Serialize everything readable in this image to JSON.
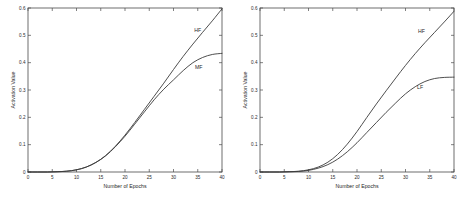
{
  "figure": {
    "background_color": "#ffffff",
    "axis_color": "#4a4a4a",
    "curve_color": "#3a3a3a",
    "text_color": "#1f1f1f"
  },
  "chart_data": [
    {
      "type": "line",
      "panel": "left",
      "title": "",
      "xlabel": "Number of Epochs",
      "ylabel": "Activation Value",
      "xlim": [
        0,
        40
      ],
      "ylim": [
        0,
        0.6
      ],
      "xticks": [
        0,
        5,
        10,
        15,
        20,
        25,
        30,
        35,
        40
      ],
      "xticklabels": [
        "0",
        "5",
        "10",
        "15",
        "20",
        "25",
        "30",
        "35",
        "40"
      ],
      "yticks": [
        0,
        0.1,
        0.2,
        0.3,
        0.4,
        0.5,
        0.6
      ],
      "yticklabels": [
        "0",
        "0.1",
        "0.2",
        "0.3",
        "0.4",
        "0.5",
        "0.6"
      ],
      "grid": false,
      "legend": "inline-annotation",
      "x": [
        0,
        2,
        4,
        6,
        8,
        10,
        12,
        14,
        16,
        18,
        20,
        22,
        24,
        26,
        28,
        30,
        32,
        34,
        36,
        38,
        40
      ],
      "series": [
        {
          "name": "HF",
          "label": "HF",
          "label_x": 35.0,
          "label_y": 0.513,
          "values": [
            0.0,
            0.0,
            0.0,
            0.001,
            0.003,
            0.008,
            0.018,
            0.035,
            0.06,
            0.094,
            0.135,
            0.181,
            0.229,
            0.277,
            0.325,
            0.375,
            0.423,
            0.468,
            0.511,
            0.553,
            0.597
          ]
        },
        {
          "name": "MF",
          "label": "MF",
          "label_x": 35.2,
          "label_y": 0.377,
          "values": [
            0.0,
            0.0,
            0.0,
            0.001,
            0.003,
            0.008,
            0.018,
            0.035,
            0.059,
            0.092,
            0.131,
            0.175,
            0.22,
            0.264,
            0.303,
            0.337,
            0.371,
            0.4,
            0.419,
            0.43,
            0.434
          ]
        }
      ]
    },
    {
      "type": "line",
      "panel": "right",
      "title": "",
      "xlabel": "Number of Epochs",
      "ylabel": "Activation Value",
      "xlim": [
        0,
        40
      ],
      "ylim": [
        0,
        0.6
      ],
      "xticks": [
        0,
        5,
        10,
        15,
        20,
        25,
        30,
        35,
        40
      ],
      "xticklabels": [
        "0",
        "5",
        "10",
        "15",
        "20",
        "25",
        "30",
        "35",
        "40"
      ],
      "yticks": [
        0,
        0.1,
        0.2,
        0.3,
        0.4,
        0.5,
        0.6
      ],
      "yticklabels": [
        "0",
        "0.1",
        "0.2",
        "0.3",
        "0.4",
        "0.5",
        "0.6"
      ],
      "grid": false,
      "legend": "inline-annotation",
      "x": [
        0,
        2,
        4,
        6,
        8,
        10,
        12,
        14,
        16,
        18,
        20,
        22,
        24,
        26,
        28,
        30,
        32,
        34,
        36,
        38,
        40
      ],
      "series": [
        {
          "name": "HF",
          "label": "HF",
          "label_x": 33.3,
          "label_y": 0.508,
          "values": [
            0.0,
            0.0,
            0.0,
            0.001,
            0.003,
            0.008,
            0.018,
            0.036,
            0.064,
            0.102,
            0.148,
            0.199,
            0.249,
            0.297,
            0.344,
            0.39,
            0.433,
            0.473,
            0.511,
            0.549,
            0.588
          ]
        },
        {
          "name": "LF",
          "label": "LF",
          "label_x": 33.0,
          "label_y": 0.303,
          "values": [
            0.0,
            0.0,
            0.0,
            0.001,
            0.002,
            0.006,
            0.014,
            0.027,
            0.047,
            0.074,
            0.107,
            0.144,
            0.181,
            0.218,
            0.253,
            0.286,
            0.312,
            0.331,
            0.342,
            0.346,
            0.347
          ]
        }
      ]
    }
  ]
}
